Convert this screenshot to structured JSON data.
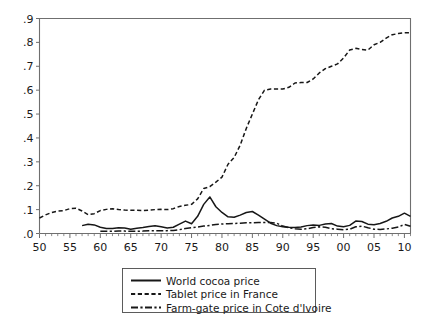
{
  "chart_data": {
    "type": "line",
    "title": "",
    "subtitle": "",
    "xlabel": "",
    "ylabel": "",
    "xlim": [
      1950,
      2011
    ],
    "ylim": [
      0,
      0.9
    ],
    "grid": false,
    "legend_position": "bottom-center",
    "y_ticks": [
      0,
      0.1,
      0.2,
      0.3,
      0.4,
      0.5,
      0.6,
      0.7,
      0.8,
      0.9
    ],
    "y_tick_labels": [
      ".0",
      ".1",
      ".2",
      ".3",
      ".4",
      ".5",
      ".6",
      ".7",
      ".8",
      ".9"
    ],
    "x_ticks": [
      1950,
      1955,
      1960,
      1965,
      1970,
      1975,
      1980,
      1985,
      1990,
      1995,
      2000,
      2005,
      2010
    ],
    "x_tick_labels": [
      "50",
      "55",
      "60",
      "65",
      "70",
      "75",
      "80",
      "85",
      "90",
      "95",
      "00",
      "05",
      "10"
    ],
    "x_minor_tick_step": 1,
    "series": [
      {
        "name": "World cocoa price",
        "style": "solid",
        "color": "#171717",
        "x": [
          1957,
          1958,
          1959,
          1960,
          1961,
          1962,
          1963,
          1964,
          1965,
          1966,
          1967,
          1968,
          1969,
          1970,
          1971,
          1972,
          1973,
          1974,
          1975,
          1976,
          1977,
          1978,
          1979,
          1980,
          1981,
          1982,
          1983,
          1984,
          1985,
          1986,
          1987,
          1988,
          1989,
          1990,
          1991,
          1992,
          1993,
          1994,
          1995,
          1996,
          1997,
          1998,
          1999,
          2000,
          2001,
          2002,
          2003,
          2004,
          2005,
          2006,
          2007,
          2008,
          2009,
          2010,
          2011
        ],
        "values": [
          0.033,
          0.039,
          0.036,
          0.026,
          0.021,
          0.021,
          0.024,
          0.023,
          0.018,
          0.022,
          0.025,
          0.029,
          0.032,
          0.028,
          0.023,
          0.026,
          0.039,
          0.052,
          0.041,
          0.072,
          0.122,
          0.153,
          0.112,
          0.088,
          0.07,
          0.068,
          0.077,
          0.088,
          0.092,
          0.077,
          0.06,
          0.043,
          0.033,
          0.028,
          0.026,
          0.025,
          0.027,
          0.033,
          0.036,
          0.034,
          0.04,
          0.042,
          0.031,
          0.028,
          0.034,
          0.052,
          0.05,
          0.039,
          0.037,
          0.042,
          0.051,
          0.065,
          0.072,
          0.085,
          0.072
        ],
        "units": "relative price index"
      },
      {
        "name": "Tablet price in France",
        "style": "dashed",
        "color": "#171717",
        "x": [
          1950,
          1951,
          1952,
          1953,
          1954,
          1955,
          1956,
          1957,
          1958,
          1959,
          1960,
          1961,
          1962,
          1963,
          1964,
          1965,
          1966,
          1967,
          1968,
          1969,
          1970,
          1971,
          1972,
          1973,
          1974,
          1975,
          1976,
          1977,
          1978,
          1979,
          1980,
          1981,
          1982,
          1983,
          1984,
          1985,
          1986,
          1987,
          1988,
          1989,
          1990,
          1991,
          1992,
          1993,
          1994,
          1995,
          1996,
          1997,
          1998,
          1999,
          2000,
          2001,
          2002,
          2003,
          2004,
          2005,
          2006,
          2007,
          2008,
          2009,
          2010,
          2011
        ],
        "values": [
          0.065,
          0.078,
          0.088,
          0.094,
          0.096,
          0.104,
          0.106,
          0.094,
          0.079,
          0.083,
          0.096,
          0.101,
          0.104,
          0.1,
          0.098,
          0.097,
          0.097,
          0.096,
          0.098,
          0.1,
          0.101,
          0.1,
          0.104,
          0.113,
          0.118,
          0.122,
          0.145,
          0.188,
          0.196,
          0.215,
          0.236,
          0.29,
          0.318,
          0.37,
          0.44,
          0.5,
          0.56,
          0.6,
          0.605,
          0.605,
          0.605,
          0.612,
          0.63,
          0.632,
          0.632,
          0.647,
          0.672,
          0.69,
          0.7,
          0.71,
          0.735,
          0.768,
          0.775,
          0.77,
          0.768,
          0.79,
          0.8,
          0.818,
          0.832,
          0.837,
          0.84,
          0.84
        ],
        "units": "relative price index"
      },
      {
        "name": "Farm-gate price in Cote d'Ivoire",
        "style": "dash-dot",
        "color": "#171717",
        "x": [
          1960,
          1961,
          1962,
          1963,
          1964,
          1965,
          1966,
          1967,
          1968,
          1969,
          1970,
          1971,
          1972,
          1973,
          1974,
          1975,
          1976,
          1977,
          1978,
          1979,
          1980,
          1981,
          1982,
          1983,
          1984,
          1985,
          1986,
          1987,
          1988,
          1989,
          1990,
          1991,
          1992,
          1993,
          1994,
          1995,
          1996,
          1997,
          1998,
          1999,
          2000,
          2001,
          2002,
          2003,
          2004,
          2005,
          2006,
          2007,
          2008,
          2009,
          2010,
          2011
        ],
        "values": [
          0.009,
          0.009,
          0.009,
          0.01,
          0.01,
          0.009,
          0.009,
          0.01,
          0.012,
          0.012,
          0.012,
          0.012,
          0.013,
          0.016,
          0.021,
          0.024,
          0.027,
          0.031,
          0.034,
          0.038,
          0.04,
          0.041,
          0.042,
          0.043,
          0.045,
          0.045,
          0.046,
          0.046,
          0.046,
          0.043,
          0.031,
          0.024,
          0.02,
          0.018,
          0.02,
          0.025,
          0.028,
          0.026,
          0.02,
          0.018,
          0.016,
          0.018,
          0.028,
          0.031,
          0.024,
          0.018,
          0.017,
          0.019,
          0.022,
          0.027,
          0.038,
          0.03
        ],
        "units": "relative price index"
      }
    ]
  },
  "legend": {
    "entries": [
      {
        "label": "World cocoa price",
        "style": "solid"
      },
      {
        "label": "Tablet price in France",
        "style": "dashed"
      },
      {
        "label": "Farm-gate price in Cote d'Ivoire",
        "style": "dash-dot"
      }
    ]
  }
}
